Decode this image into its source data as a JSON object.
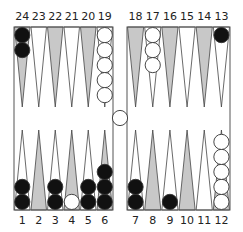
{
  "board": {
    "title": "Backgammon position",
    "colors": {
      "background": "#ffffff",
      "frame": "#555555",
      "point_light": "#ffffff",
      "point_dark": "#c8c8c8",
      "point_outline": "#444444",
      "checker_black": "#111111",
      "checker_white": "#ffffff",
      "checker_outline": "#333333"
    },
    "top_numbers": [
      "24",
      "23",
      "22",
      "21",
      "20",
      "19",
      "18",
      "17",
      "16",
      "15",
      "14",
      "13"
    ],
    "bottom_numbers": [
      "1",
      "2",
      "3",
      "4",
      "5",
      "6",
      "7",
      "8",
      "9",
      "10",
      "11",
      "12"
    ],
    "points": [
      {
        "point": 1,
        "color": "black",
        "count": 2
      },
      {
        "point": 2,
        "color": null,
        "count": 0
      },
      {
        "point": 3,
        "color": "black",
        "count": 2
      },
      {
        "point": 4,
        "color": "white",
        "count": 1
      },
      {
        "point": 5,
        "color": "black",
        "count": 2
      },
      {
        "point": 6,
        "color": "black",
        "count": 3
      },
      {
        "point": 7,
        "color": "black",
        "count": 2
      },
      {
        "point": 8,
        "color": null,
        "count": 0
      },
      {
        "point": 9,
        "color": "black",
        "count": 1
      },
      {
        "point": 10,
        "color": null,
        "count": 0
      },
      {
        "point": 11,
        "color": null,
        "count": 0
      },
      {
        "point": 12,
        "color": "white",
        "count": 5
      },
      {
        "point": 13,
        "color": "black",
        "count": 1
      },
      {
        "point": 14,
        "color": null,
        "count": 0
      },
      {
        "point": 15,
        "color": null,
        "count": 0
      },
      {
        "point": 16,
        "color": null,
        "count": 0
      },
      {
        "point": 17,
        "color": "white",
        "count": 3
      },
      {
        "point": 18,
        "color": null,
        "count": 0
      },
      {
        "point": 19,
        "color": "white",
        "count": 5
      },
      {
        "point": 20,
        "color": null,
        "count": 0
      },
      {
        "point": 21,
        "color": null,
        "count": 0
      },
      {
        "point": 22,
        "color": null,
        "count": 0
      },
      {
        "point": 23,
        "color": null,
        "count": 0
      },
      {
        "point": 24,
        "color": "black",
        "count": 2
      }
    ],
    "bar": {
      "white": 1,
      "black": 0
    }
  }
}
